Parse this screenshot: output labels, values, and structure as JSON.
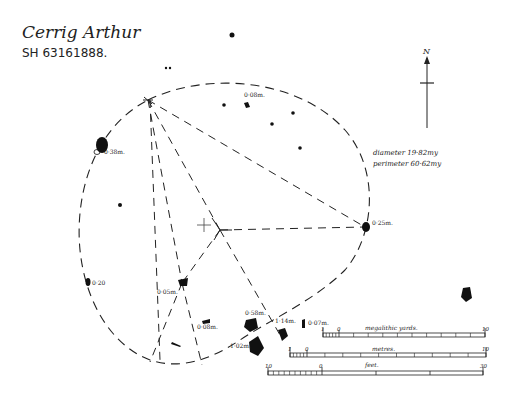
{
  "title": {
    "name": "Cerrig Arthur",
    "grid_ref": "SH 63161888."
  },
  "north_arrow": {
    "label": "N"
  },
  "measurements": {
    "diameter": "diameter 19·82my",
    "perimeter": "perimeter 60·62my"
  },
  "stone_labels": [
    "0·08m.",
    "0·38m.",
    "0·25m.",
    "0·20",
    "0·05m.",
    "0·08m.",
    "0·58m.",
    "1·14m.",
    "0·07m.",
    "1·02m."
  ],
  "scales": {
    "megalithic_yards": {
      "label": "megalithic yards.",
      "start": "1",
      "zero": "0",
      "end": "10"
    },
    "metres": {
      "label": "metres.",
      "start": "1",
      "zero": "0",
      "end": "10"
    },
    "feet": {
      "label": "feet.",
      "start": "10",
      "zero": "0",
      "end": "30"
    }
  },
  "colors": {
    "ink": "#1a1a1a",
    "paper": "#ffffff"
  }
}
